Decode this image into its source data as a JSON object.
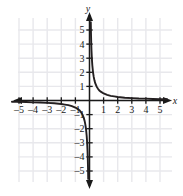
{
  "figure": {
    "background_color": "#ffffff",
    "grid_color": "#e8e8ec",
    "axis_color": "#1a1a1a",
    "curve_color": "#231f20",
    "x_axis_label": "x",
    "y_axis_label": "y"
  },
  "axes": {
    "x_ticks": [
      "-5",
      "-4",
      "-3",
      "-2",
      "-1",
      "1",
      "2",
      "3",
      "4",
      "5"
    ],
    "y_ticks": [
      "5",
      "4",
      "3",
      "2",
      "1",
      "-1",
      "-2",
      "-3",
      "-4",
      "-5"
    ]
  },
  "chart_data": {
    "type": "line",
    "title": "",
    "xlabel": "x",
    "ylabel": "y",
    "xlim": [
      -5.8,
      5.8
    ],
    "ylim": [
      -5.8,
      5.8
    ],
    "grid": true,
    "legend": "none",
    "x_ticks": [
      -5,
      -4,
      -3,
      -2,
      -1,
      1,
      2,
      3,
      4,
      5
    ],
    "y_ticks": [
      5,
      4,
      3,
      2,
      1,
      -1,
      -2,
      -3,
      -4,
      -5
    ],
    "function": "y = 0.5 / x",
    "series": [
      {
        "name": "branch-quadrant-I",
        "x": [
          0.09,
          0.1,
          0.11,
          0.125,
          0.14,
          0.16,
          0.18,
          0.2,
          0.25,
          0.3,
          0.35,
          0.4,
          0.5,
          0.6,
          0.7,
          0.8,
          1.0,
          1.25,
          1.5,
          1.75,
          2.0,
          2.5,
          3.0,
          3.5,
          4.0,
          4.5,
          5.0,
          5.5
        ],
        "y": [
          5.56,
          5.0,
          4.55,
          4.0,
          3.57,
          3.13,
          2.78,
          2.5,
          2.0,
          1.67,
          1.43,
          1.25,
          1.0,
          0.83,
          0.71,
          0.63,
          0.5,
          0.4,
          0.33,
          0.29,
          0.25,
          0.2,
          0.17,
          0.14,
          0.13,
          0.11,
          0.1,
          0.09
        ]
      },
      {
        "name": "branch-quadrant-III",
        "x": [
          -5.5,
          -5.0,
          -4.5,
          -4.0,
          -3.5,
          -3.0,
          -2.5,
          -2.0,
          -1.75,
          -1.5,
          -1.25,
          -1.0,
          -0.8,
          -0.7,
          -0.6,
          -0.5,
          -0.4,
          -0.35,
          -0.3,
          -0.25,
          -0.2,
          -0.18,
          -0.16,
          -0.14,
          -0.125,
          -0.11,
          -0.1,
          -0.09
        ],
        "y": [
          -0.09,
          -0.1,
          -0.11,
          -0.13,
          -0.14,
          -0.17,
          -0.2,
          -0.25,
          -0.29,
          -0.33,
          -0.4,
          -0.5,
          -0.63,
          -0.71,
          -0.83,
          -1.0,
          -1.25,
          -1.43,
          -1.67,
          -2.0,
          -2.5,
          -2.78,
          -3.13,
          -3.57,
          -4.0,
          -4.55,
          -5.0,
          -5.56
        ]
      }
    ]
  }
}
